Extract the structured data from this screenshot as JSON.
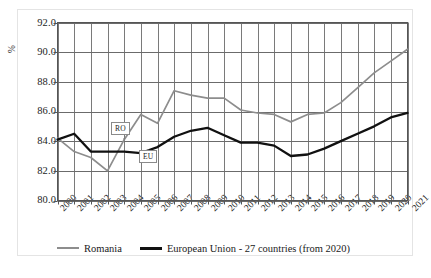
{
  "figure": {
    "caption": ""
  },
  "axes": {
    "y_unit_label": "%",
    "y_ticks": [
      "80.0",
      "82.0",
      "84.0",
      "86.0",
      "88.0",
      "90.0",
      "92.0"
    ],
    "x_ticks": [
      "2000",
      "2001",
      "2002",
      "2003",
      "2004",
      "2005",
      "2006",
      "2007",
      "2008",
      "2009",
      "2010",
      "2011",
      "2012",
      "2013",
      "2014",
      "2015",
      "2016",
      "2017",
      "2018",
      "2019",
      "2020",
      "2021"
    ]
  },
  "annotations": [
    {
      "name": "ro-tag",
      "label": "RO"
    },
    {
      "name": "eu-tag",
      "label": "EU"
    }
  ],
  "legend": {
    "items": [
      {
        "label": "Romania",
        "color": "#8d8d8d"
      },
      {
        "label": "European Union - 27 countries (from 2020)",
        "color": "#111111"
      }
    ]
  },
  "chart_data": {
    "type": "line",
    "title": "",
    "xlabel": "",
    "ylabel": "%",
    "ylim": [
      80.0,
      92.0
    ],
    "ytick_step": 2.0,
    "grid": "both",
    "legend_position": "bottom",
    "x": [
      2000,
      2001,
      2002,
      2003,
      2004,
      2005,
      2006,
      2007,
      2008,
      2009,
      2010,
      2011,
      2012,
      2013,
      2014,
      2015,
      2016,
      2017,
      2018,
      2019,
      2020,
      2021
    ],
    "series": [
      {
        "name": "Romania",
        "color": "#8d8d8d",
        "values": [
          84.2,
          83.3,
          82.9,
          82.0,
          84.1,
          85.8,
          85.2,
          87.4,
          87.1,
          86.9,
          86.9,
          86.1,
          85.9,
          85.8,
          85.3,
          85.8,
          85.9,
          86.6,
          87.6,
          88.6,
          89.4,
          90.2
        ]
      },
      {
        "name": "European Union - 27 countries (from 2020)",
        "color": "#111111",
        "values": [
          84.1,
          84.5,
          83.3,
          83.3,
          83.3,
          83.2,
          83.6,
          84.3,
          84.7,
          84.9,
          84.4,
          83.9,
          83.9,
          83.7,
          83.0,
          83.1,
          83.5,
          84.0,
          84.5,
          85.0,
          85.6,
          85.9
        ]
      }
    ]
  }
}
